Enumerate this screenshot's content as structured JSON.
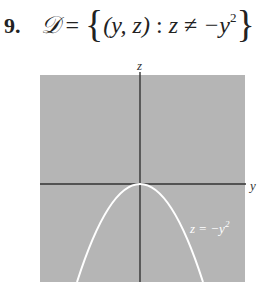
{
  "problem": {
    "number": "9.",
    "set_name": "𝒟",
    "equals": "=",
    "open_brace": "{",
    "pair": "(y, z)",
    "colon": ":",
    "condition_lhs": "z",
    "neq": "≠",
    "condition_rhs": "−y",
    "exponent": "2",
    "close_brace": "}"
  },
  "figure": {
    "axis_label_vertical": "z",
    "axis_label_horizontal": "y",
    "curve_label": "z = −y",
    "curve_label_exp": "2",
    "colors": {
      "region_fill": "#b5b5b5",
      "axis": "#333333",
      "curve": "#ffffff"
    }
  }
}
